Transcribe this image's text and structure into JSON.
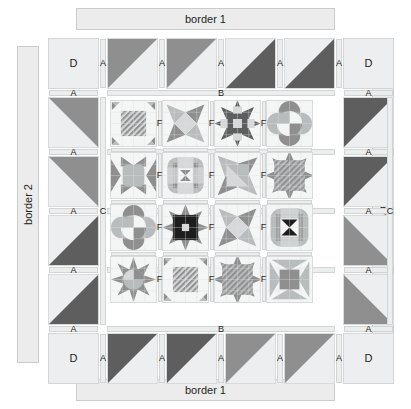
{
  "diagram": {
    "width": 411,
    "height": 409
  },
  "borders": {
    "top_label": "border 1",
    "bottom_label": "border 1",
    "left_label": "border 2",
    "right_label": "border 2"
  },
  "labels": {
    "A": "A",
    "B": "B",
    "C": "C",
    "D": "D",
    "F": "F",
    "G": "G"
  },
  "colors": {
    "background": "#ffffff",
    "light": "#eceeef",
    "light_alt": "#f4f5f5",
    "sashing": "#eceded",
    "sashing_edge": "#d2d4d5",
    "border_fill": "#ececec",
    "border_edge": "#c9cbcc",
    "dark_gray": "#5e5e5e",
    "mid_gray": "#8f8f8f",
    "light_gray": "#b9bcbd",
    "pale_gray": "#d6d8d9",
    "near_black": "#1d1d1d",
    "text": "#231f20"
  },
  "corner_squares": [
    {
      "name": "top-left",
      "label": "D"
    },
    {
      "name": "top-right",
      "label": "D"
    },
    {
      "name": "bottom-left",
      "label": "D"
    },
    {
      "name": "bottom-right",
      "label": "D"
    }
  ],
  "half_square_triangles": {
    "top_row": [
      {
        "index": 1,
        "shade": "mid_gray",
        "orientation": "upper-left"
      },
      {
        "index": 2,
        "shade": "mid_gray",
        "orientation": "upper-left"
      },
      {
        "index": 3,
        "shade": "dark_gray",
        "orientation": "lower-right"
      },
      {
        "index": 4,
        "shade": "dark_gray",
        "orientation": "lower-right"
      }
    ],
    "bottom_row": [
      {
        "index": 1,
        "shade": "dark_gray",
        "orientation": "upper-left"
      },
      {
        "index": 2,
        "shade": "dark_gray",
        "orientation": "upper-left"
      },
      {
        "index": 3,
        "shade": "mid_gray",
        "orientation": "upper-left"
      },
      {
        "index": 4,
        "shade": "mid_gray",
        "orientation": "upper-left"
      }
    ],
    "left_column": [
      {
        "index": 1,
        "shade": "mid_gray",
        "orientation": "upper-right"
      },
      {
        "index": 2,
        "shade": "mid_gray",
        "orientation": "upper-right"
      },
      {
        "index": 3,
        "shade": "dark_gray",
        "orientation": "lower-right"
      },
      {
        "index": 4,
        "shade": "dark_gray",
        "orientation": "lower-right"
      }
    ],
    "right_column": [
      {
        "index": 1,
        "shade": "dark_gray",
        "orientation": "upper-left"
      },
      {
        "index": 2,
        "shade": "dark_gray",
        "orientation": "upper-left"
      },
      {
        "index": 3,
        "shade": "mid_gray",
        "orientation": "lower-left"
      },
      {
        "index": 4,
        "shade": "mid_gray",
        "orientation": "lower-left"
      }
    ]
  },
  "center_blocks": {
    "rows": 4,
    "cols": 4,
    "items": [
      {
        "row": 1,
        "col": 1,
        "pattern": "diagonal-stripe-bowtie"
      },
      {
        "row": 1,
        "col": 2,
        "pattern": "friendship-star-pinwheel"
      },
      {
        "row": 1,
        "col": 3,
        "pattern": "dark-sawtooth-star"
      },
      {
        "row": 1,
        "col": 4,
        "pattern": "orange-peel-pinwheel"
      },
      {
        "row": 2,
        "col": 1,
        "pattern": "hourglass-star"
      },
      {
        "row": 2,
        "col": 2,
        "pattern": "rounded-square-frame"
      },
      {
        "row": 2,
        "col": 3,
        "pattern": "twisted-star"
      },
      {
        "row": 2,
        "col": 4,
        "pattern": "diagonal-stripe-star"
      },
      {
        "row": 3,
        "col": 1,
        "pattern": "orange-peel-pinwheel"
      },
      {
        "row": 3,
        "col": 2,
        "pattern": "black-sawtooth-star"
      },
      {
        "row": 3,
        "col": 3,
        "pattern": "friendship-star-pinwheel"
      },
      {
        "row": 3,
        "col": 4,
        "pattern": "rounded-square-bowtie"
      },
      {
        "row": 4,
        "col": 1,
        "pattern": "eight-point-star"
      },
      {
        "row": 4,
        "col": 2,
        "pattern": "diagonal-stripe-bowtie"
      },
      {
        "row": 4,
        "col": 3,
        "pattern": "diagonal-stripe-star"
      },
      {
        "row": 4,
        "col": 4,
        "pattern": "hourglass-star-light"
      }
    ]
  },
  "sashing_labels": {
    "inner_horizontal": [
      "B",
      "G",
      "G",
      "G",
      "B"
    ],
    "inner_vertical": [
      "C",
      "C"
    ],
    "between_blocks": "F",
    "outer_short": "A"
  }
}
